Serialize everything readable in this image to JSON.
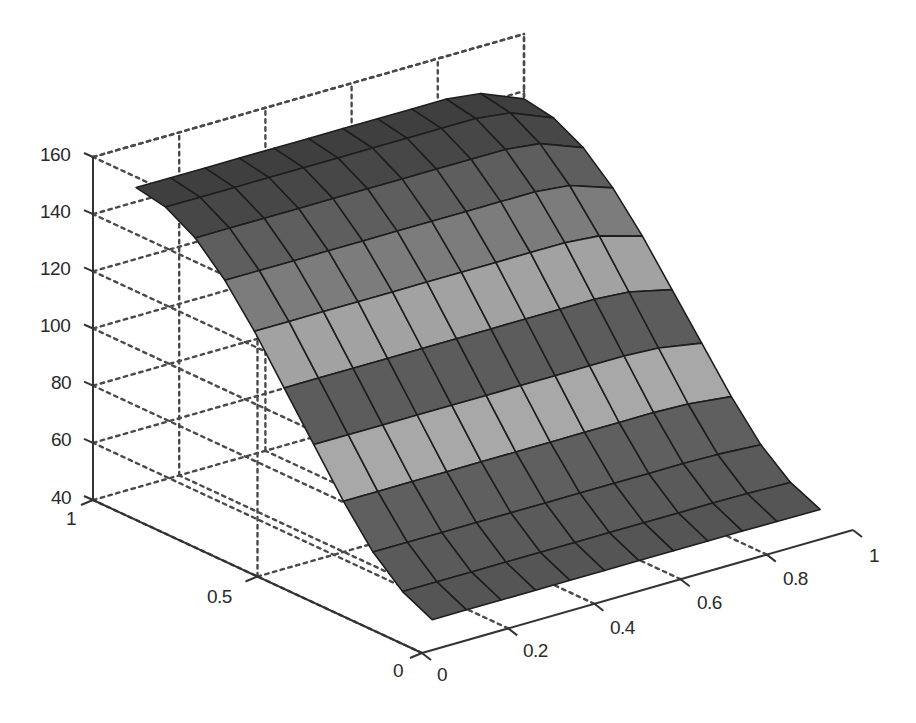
{
  "chart_data": {
    "type": "surface",
    "title": "",
    "xlabel": "",
    "ylabel": "",
    "zlabel": "",
    "xlim": [
      0,
      1
    ],
    "ylim": [
      0,
      1
    ],
    "zlim": [
      40,
      160
    ],
    "grid": true,
    "grid_style": "dashed",
    "x_ticks": [
      "0",
      "0.2",
      "0.4",
      "0.6",
      "0.8",
      "1"
    ],
    "y_ticks": [
      "0",
      "0.5",
      "1"
    ],
    "z_ticks": [
      "40",
      "60",
      "80",
      "100",
      "120",
      "140",
      "160"
    ],
    "x": [
      0.1,
      0.18,
      0.26,
      0.34,
      0.42,
      0.5,
      0.58,
      0.66,
      0.74,
      0.82,
      0.9,
      1.0
    ],
    "y": [
      0.1,
      0.19,
      0.28,
      0.37,
      0.46,
      0.55,
      0.64,
      0.73,
      0.82,
      0.91,
      1.0
    ],
    "z_profile_along_y": [
      42,
      47,
      56,
      69,
      84,
      99,
      114,
      127,
      137,
      143,
      145
    ],
    "x_edge_falloff": {
      "start": 0.82,
      "drop_at_x1": 4
    },
    "row_colors": [
      "#555555",
      "#5a5a5a",
      "#5f5f5f",
      "#a8a8a8",
      "#5c5c5c",
      "#a2a2a2",
      "#7c7c7c",
      "#5e5e5e",
      "#474747",
      "#3f3f3f",
      "#3a3a3a"
    ]
  },
  "axes": {
    "z_tick_labels": [
      "160",
      "140",
      "120",
      "100",
      "80",
      "60",
      "40"
    ],
    "y_tick_labels": [
      "1",
      "0.5",
      "0"
    ],
    "x_tick_labels": [
      "0",
      "0.2",
      "0.4",
      "0.6",
      "0.8",
      "1"
    ]
  }
}
